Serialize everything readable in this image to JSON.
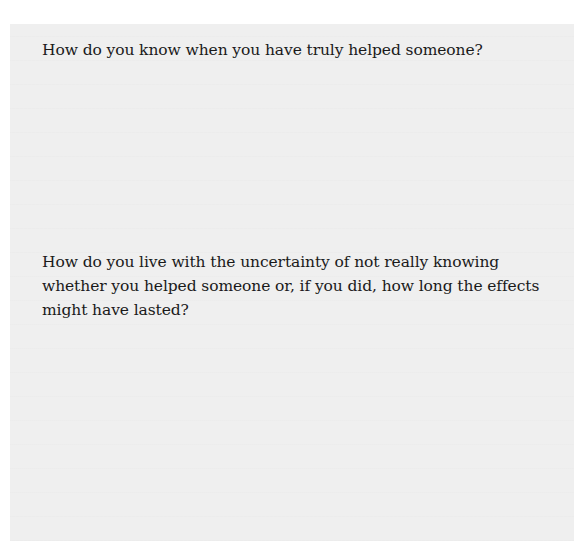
{
  "document": {
    "questions": [
      {
        "text": "How do you know when you have truly helped someone?"
      },
      {
        "text": "How do you live with the uncertainty of not really knowing whether you helped someone or, if you did, how long the effects might have lasted?"
      }
    ]
  },
  "colors": {
    "page_background": "#ffffff",
    "box_background": "#efefef",
    "text": "#1a1a1a"
  }
}
